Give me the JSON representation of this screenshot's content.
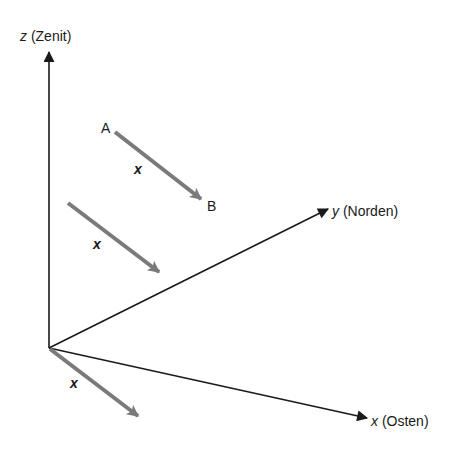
{
  "diagram": {
    "type": "3d-coordinate-system",
    "colors": {
      "axis": "#1a1a1a",
      "vector": "#7a7a7a",
      "background": "#ffffff"
    },
    "origin": {
      "x": 49,
      "y": 348
    },
    "axes": [
      {
        "id": "z",
        "var": "z",
        "label": " (Zenit)",
        "tip": {
          "x": 49,
          "y": 52
        }
      },
      {
        "id": "y",
        "var": "y",
        "label": " (Norden)",
        "tip": {
          "x": 328,
          "y": 209
        }
      },
      {
        "id": "x",
        "var": "x",
        "label": " (Osten)",
        "tip": {
          "x": 367,
          "y": 418
        }
      }
    ],
    "vectors": [
      {
        "id": "ab",
        "name": "x",
        "start": {
          "x": 115,
          "y": 132
        },
        "end": {
          "x": 201,
          "y": 199
        },
        "start_label": "A",
        "end_label": "B"
      },
      {
        "id": "middle",
        "name": "x",
        "start": {
          "x": 68,
          "y": 203
        },
        "end": {
          "x": 159,
          "y": 272
        }
      },
      {
        "id": "origin",
        "name": "x",
        "start": {
          "x": 50,
          "y": 349
        },
        "end": {
          "x": 138,
          "y": 416
        }
      }
    ]
  }
}
